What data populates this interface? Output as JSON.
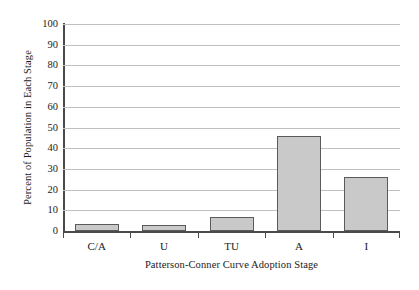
{
  "chart_data": {
    "type": "bar",
    "title": "",
    "categories": [
      "C/A",
      "U",
      "TU",
      "A",
      "I"
    ],
    "values": [
      3.5,
      3,
      7,
      46,
      26
    ],
    "xlabel": "Patterson-Conner Curve Adoption Stage",
    "ylabel": "Percent of Population in Each Stage",
    "ylim": [
      0,
      100
    ],
    "ytick_labels": [
      "100",
      "90",
      "80",
      "70",
      "60",
      "50",
      "40",
      "30",
      "20",
      "10",
      "0"
    ],
    "ytick_values": [
      100,
      90,
      80,
      70,
      60,
      50,
      40,
      30,
      20,
      10,
      0
    ],
    "grid": true,
    "legend": false,
    "series": [
      {
        "name": "Percent of Population in Each Stage",
        "values": [
          3.5,
          3,
          7,
          46,
          26
        ]
      }
    ],
    "colors": {
      "bar_fill": "#c9c9c9",
      "bar_border": "#5a5a5a",
      "gridline": "#c0c0c0",
      "axis": "#4a4a4a",
      "background": "#ffffff",
      "text": "#1a1a1a"
    }
  }
}
